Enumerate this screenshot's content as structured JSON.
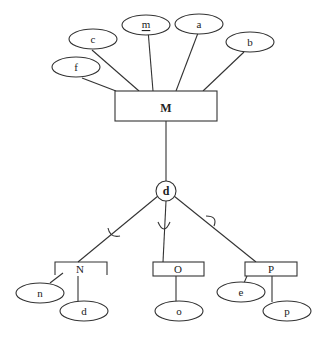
{
  "diagram": {
    "type": "EER diagram",
    "entity": {
      "name": "M"
    },
    "entity_attributes": [
      {
        "id": "f",
        "label": "f",
        "key": false
      },
      {
        "id": "c",
        "label": "c",
        "key": false
      },
      {
        "id": "m",
        "label": "m",
        "key": true
      },
      {
        "id": "a",
        "label": "a",
        "key": false
      },
      {
        "id": "b",
        "label": "b",
        "key": false
      }
    ],
    "specialization": {
      "label": "d",
      "constraint": "disjoint"
    },
    "subclasses": [
      {
        "id": "N",
        "label": "N",
        "attributes": [
          {
            "id": "n",
            "label": "n"
          },
          {
            "id": "d",
            "label": "d"
          }
        ]
      },
      {
        "id": "O",
        "label": "O",
        "attributes": [
          {
            "id": "o",
            "label": "o"
          }
        ]
      },
      {
        "id": "P",
        "label": "P",
        "attributes": [
          {
            "id": "e",
            "label": "e"
          },
          {
            "id": "p",
            "label": "p"
          }
        ]
      }
    ]
  }
}
